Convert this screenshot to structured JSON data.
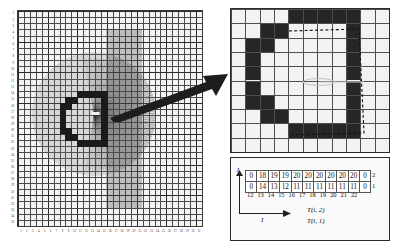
{
  "figure": {
    "domain": "technical-diagram"
  },
  "left_panel": {
    "name": "simulation-grid",
    "x_ticks": [
      "1",
      "2",
      "3",
      "4",
      "5",
      "6",
      "7",
      "8",
      "9",
      "10",
      "11",
      "12",
      "13",
      "14",
      "15",
      "16",
      "17",
      "18",
      "19",
      "20",
      "21",
      "22",
      "23",
      "24",
      "25",
      "26",
      "27",
      "28",
      "29",
      "30",
      "31"
    ],
    "y_ticks": [
      "1",
      "2",
      "3",
      "4",
      "5",
      "6",
      "7",
      "8",
      "9",
      "10",
      "11",
      "12",
      "13",
      "14",
      "15",
      "16",
      "17",
      "18",
      "19",
      "20",
      "21",
      "22",
      "23",
      "24",
      "25",
      "26",
      "27",
      "28",
      "29",
      "30",
      "31",
      "32",
      "33",
      "34",
      "35"
    ],
    "grid_cols": 31,
    "grid_rows": 35,
    "source_marker": "point-source",
    "obstacle_shape": "c-shaped-cavity"
  },
  "zoom_panel": {
    "name": "magnified-cells",
    "cols": 11,
    "rows": 10,
    "occupied_cells": [
      [
        4,
        0
      ],
      [
        5,
        0
      ],
      [
        6,
        0
      ],
      [
        7,
        0
      ],
      [
        8,
        0
      ],
      [
        2,
        1
      ],
      [
        3,
        1
      ],
      [
        8,
        1
      ],
      [
        2,
        2
      ],
      [
        8,
        2
      ],
      [
        1,
        2
      ],
      [
        1,
        3
      ],
      [
        8,
        3
      ],
      [
        1,
        4
      ],
      [
        8,
        4
      ],
      [
        1,
        5
      ],
      [
        8,
        5
      ],
      [
        1,
        6
      ],
      [
        8,
        6
      ],
      [
        2,
        6
      ],
      [
        2,
        7
      ],
      [
        3,
        7
      ],
      [
        8,
        7
      ],
      [
        4,
        8
      ],
      [
        5,
        8
      ],
      [
        6,
        8
      ],
      [
        7,
        8
      ],
      [
        8,
        8
      ]
    ],
    "dashed_boundary": "ray-path-outline",
    "center_marker": "source-ellipse"
  },
  "table_panel": {
    "name": "sample-values-table",
    "col_labels": [
      "12",
      "13",
      "14",
      "15",
      "16",
      "17",
      "18",
      "19",
      "20",
      "21",
      "22"
    ],
    "rows": [
      {
        "label": "2",
        "series": "T(i, 2)",
        "values": [
          "0",
          "18",
          "19",
          "19",
          "20",
          "20",
          "20",
          "20",
          "20",
          "20",
          "0"
        ]
      },
      {
        "label": "1",
        "series": "T(i, 1)",
        "values": [
          "0",
          "14",
          "13",
          "12",
          "11",
          "11",
          "11",
          "11",
          "11",
          "11",
          "0"
        ]
      }
    ],
    "axis_x_label": "I",
    "axis_y_label": "J",
    "annotation_top": "T(i, 2)",
    "annotation_bottom": "T(i, 1)"
  },
  "connector": {
    "name": "magnify-arrow",
    "direction": "up-right"
  },
  "colors": {
    "grid_line": "#4a4a4a",
    "cell_fill": "#262626",
    "ray": "#373737",
    "background": "#ffffff",
    "panel_bg": "#f2f2f2"
  }
}
